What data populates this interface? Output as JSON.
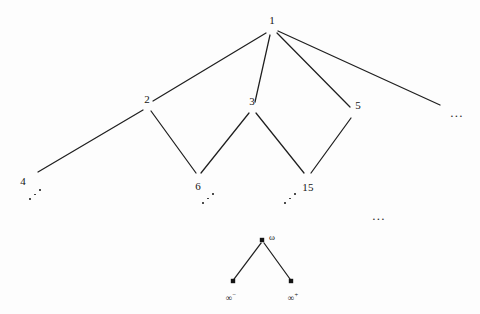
{
  "figure": {
    "background_color": "#fdfdfd",
    "edge_color": "#1f1f1f",
    "node_color": "#141414"
  },
  "upper_tree": {
    "nodes": [
      {
        "id": "n1",
        "label": "1",
        "x": 272,
        "y": 29,
        "label_x": 272,
        "label_y": 20,
        "dot": false
      },
      {
        "id": "n2",
        "label": "2",
        "x": 148,
        "y": 106,
        "label_x": 147,
        "label_y": 99,
        "dot": false
      },
      {
        "id": "n3",
        "label": "3",
        "x": 253,
        "y": 108,
        "label_x": 252,
        "label_y": 101,
        "dot": false
      },
      {
        "id": "n5",
        "label": "5",
        "x": 354,
        "y": 113,
        "label_x": 358,
        "label_y": 105,
        "dot": false
      },
      {
        "id": "n4",
        "label": "4",
        "x": 35,
        "y": 174,
        "label_x": 23,
        "label_y": 181,
        "dot": false
      },
      {
        "id": "n6",
        "label": "6",
        "x": 198,
        "y": 178,
        "label_x": 198,
        "label_y": 186,
        "dot": false
      },
      {
        "id": "n15",
        "label": "15",
        "x": 307,
        "y": 178,
        "label_x": 308,
        "label_y": 187,
        "dot": false
      }
    ],
    "edges": [
      {
        "from": "1",
        "to": "2",
        "x1": 266,
        "y1": 33,
        "x2": 153,
        "y2": 101
      },
      {
        "from": "1",
        "to": "3",
        "x1": 270,
        "y1": 35,
        "x2": 255,
        "y2": 102
      },
      {
        "from": "1",
        "to": "5",
        "x1": 277,
        "y1": 33,
        "x2": 350,
        "y2": 107
      },
      {
        "from": "1",
        "to": "dots",
        "x1": 278,
        "y1": 31,
        "x2": 440,
        "y2": 105
      },
      {
        "from": "2",
        "to": "4",
        "x1": 143,
        "y1": 110,
        "x2": 38,
        "y2": 172
      },
      {
        "from": "2",
        "to": "6",
        "x1": 151,
        "y1": 111,
        "x2": 196,
        "y2": 173
      },
      {
        "from": "3",
        "to": "6",
        "x1": 249,
        "y1": 113,
        "x2": 201,
        "y2": 173
      },
      {
        "from": "3",
        "to": "15",
        "x1": 256,
        "y1": 113,
        "x2": 304,
        "y2": 173
      },
      {
        "from": "5",
        "to": "15",
        "x1": 351,
        "y1": 118,
        "x2": 311,
        "y2": 173
      }
    ],
    "ellipses_diagonal": [
      {
        "near": "4",
        "x": 36,
        "y": 195
      },
      {
        "near": "6",
        "x": 209,
        "y": 199
      },
      {
        "near": "15",
        "x": 291,
        "y": 199
      }
    ],
    "ellipses_horizontal": [
      {
        "id": "top-right-ellipsis",
        "label": "...",
        "x": 457,
        "y": 112
      },
      {
        "id": "mid-gap-ellipsis",
        "label": "...",
        "x": 379,
        "y": 215
      }
    ]
  },
  "omega_component": {
    "nodes": [
      {
        "id": "omega",
        "label": "ω",
        "x": 262,
        "y": 240,
        "label_x": 272,
        "label_y": 237,
        "dot": true
      },
      {
        "id": "inf_minus",
        "label": "∞",
        "sup": "−",
        "x": 233,
        "y": 281,
        "label_x": 231,
        "label_y": 296,
        "dot": true
      },
      {
        "id": "inf_plus",
        "label": "∞",
        "sup": "+",
        "x": 291,
        "y": 281,
        "label_x": 293,
        "label_y": 296,
        "dot": true
      }
    ],
    "edges": [
      {
        "from": "omega",
        "to": "inf_minus",
        "x1": 261,
        "y1": 243,
        "x2": 234,
        "y2": 279
      },
      {
        "from": "omega",
        "to": "inf_plus",
        "x1": 264,
        "y1": 243,
        "x2": 290,
        "y2": 279
      }
    ]
  }
}
